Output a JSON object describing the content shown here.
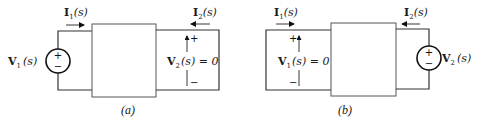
{
  "figure": {
    "colors": {
      "line": "#333333",
      "text": "#1a1a1a",
      "background": "#ffffff"
    },
    "circuit_a": {
      "caption": "(a)",
      "source_label": {
        "main": "V",
        "sub": "1",
        "arg": "(s)"
      },
      "current_in": {
        "main": "I",
        "sub": "1",
        "arg": "(s)"
      },
      "current_out": {
        "main": "I",
        "sub": "2",
        "arg": "(s)"
      },
      "port2_voltage": {
        "main": "V",
        "sub": "2",
        "arg": "(s) = 0"
      },
      "plus": "+",
      "minus": "−",
      "source_plus": "+",
      "source_minus": "−"
    },
    "circuit_b": {
      "caption": "(b)",
      "source_label": {
        "main": "V",
        "sub": "2",
        "arg": "(s)"
      },
      "current_in": {
        "main": "I",
        "sub": "1",
        "arg": "(s)"
      },
      "current_out": {
        "main": "I",
        "sub": "2",
        "arg": "(s)"
      },
      "port1_voltage": {
        "main": "V",
        "sub": "1",
        "arg": "(s) = 0"
      },
      "plus": "+",
      "minus": "−",
      "source_plus": "+",
      "source_minus": "−"
    }
  }
}
